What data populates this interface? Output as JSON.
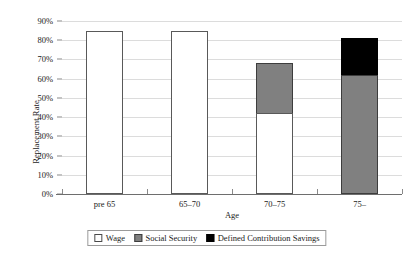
{
  "chart_data": {
    "type": "bar",
    "subtype": "stacked-bar",
    "title": "",
    "xlabel": "Age",
    "ylabel": "Replacement Rate",
    "categories": [
      "pre 65",
      "65–70",
      "70–75",
      "75–"
    ],
    "series": [
      {
        "name": "Wage",
        "values": [
          85,
          85,
          42,
          0
        ],
        "color": "#ffffff"
      },
      {
        "name": "Social Security",
        "values": [
          0,
          0,
          26,
          62
        ],
        "color": "#808080"
      },
      {
        "name": "Defined Contribution Savings",
        "values": [
          0,
          0,
          0,
          19
        ],
        "color": "#000000"
      }
    ],
    "totals": [
      85,
      85,
      68,
      81
    ],
    "ylim": [
      0,
      90
    ],
    "ytick_values": [
      0,
      10,
      20,
      30,
      40,
      50,
      60,
      70,
      80,
      90
    ],
    "ytick_labels": [
      "0%",
      "10%",
      "20%",
      "30%",
      "40%",
      "50%",
      "60%",
      "70%",
      "80%",
      "90%"
    ],
    "grid": true,
    "grid_axis": "y",
    "legend_position": "bottom",
    "legend_entries": [
      "Wage",
      "Social Security",
      "Defined Contribution Savings"
    ]
  },
  "axes": {
    "y_title": "Replacement Rate",
    "x_title": "Age"
  },
  "colors": {
    "wage": "#ffffff",
    "social_security": "#808080",
    "defined_contribution_savings": "#000000",
    "grid": "#dcdcdc",
    "axis": "#6e6e6e",
    "text": "#1a1a1a"
  }
}
